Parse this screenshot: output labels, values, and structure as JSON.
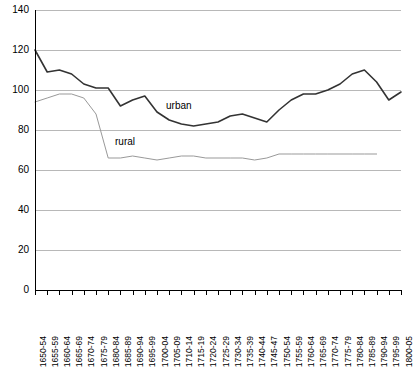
{
  "chart_data": {
    "type": "line",
    "title": "",
    "subtitle": "",
    "xlabel": "",
    "ylabel": "",
    "ylim": [
      0,
      140
    ],
    "ytick_step": 20,
    "yticks": [
      140,
      120,
      100,
      80,
      60,
      40,
      20,
      0
    ],
    "grid": true,
    "legend_position": "inline-annotations",
    "categories": [
      "1650-54",
      "1655-59",
      "1660-64",
      "1665-69",
      "1670-74",
      "1675-79",
      "1680-84",
      "1685-89",
      "1690-94",
      "1695-99",
      "1700-04",
      "1705-09",
      "1710-14",
      "1715-19",
      "1720-24",
      "1725-29",
      "1730-34",
      "1735-39",
      "1740-44",
      "1745-47",
      "1750-54",
      "1755-59",
      "1760-64",
      "1765-69",
      "1770-74",
      "1775-79",
      "1780-84",
      "1785-89",
      "1790-94",
      "1795-99",
      "1800-05"
    ],
    "series": [
      {
        "name": "urban",
        "color": "#333333",
        "annotation": "urban",
        "values": [
          120,
          109,
          110,
          108,
          103,
          101,
          101,
          92,
          95,
          97,
          89,
          85,
          83,
          82,
          83,
          84,
          87,
          88,
          86,
          84,
          90,
          95,
          98,
          98,
          100,
          103,
          108,
          110,
          104,
          95,
          99
        ]
      },
      {
        "name": "rural",
        "color": "#999999",
        "annotation": "rural",
        "values": [
          94,
          96,
          98,
          98,
          96,
          88,
          66,
          66,
          67,
          66,
          65,
          66,
          67,
          67,
          66,
          66,
          66,
          66,
          65,
          66,
          68,
          68,
          68,
          68,
          68,
          68,
          68,
          68,
          68,
          null,
          null
        ]
      }
    ]
  },
  "annotations": {
    "urban_label": "urban",
    "rural_label": "rural"
  }
}
